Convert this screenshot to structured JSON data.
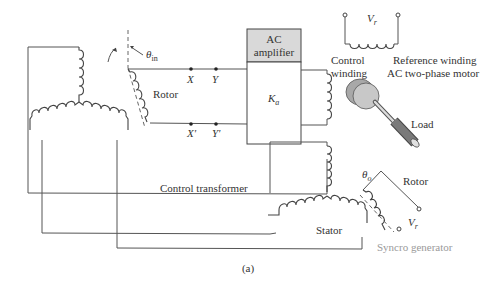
{
  "diagram": {
    "caption": "(a)",
    "labels": {
      "theta_in": "θ",
      "theta_in_sub": "in",
      "rotor_left": "Rotor",
      "terminal_x": "X",
      "terminal_y": "Y",
      "terminal_x_prime": "X'",
      "terminal_y_prime": "Y'",
      "amplifier_line1": "AC",
      "amplifier_line2": "amplifier",
      "gain": "K",
      "gain_sub": "a",
      "vr_top": "V",
      "vr_top_sub": "r",
      "control_winding_line1": "Control",
      "control_winding_line2": "winding",
      "reference_winding": "Reference winding",
      "motor": "AC two-phase motor",
      "load": "Load",
      "control_transformer": "Control transformer",
      "stator": "Stator",
      "theta_o": "θ",
      "theta_o_sub": "o",
      "rotor_right": "Rotor",
      "vr_bottom": "V",
      "vr_bottom_sub": "r",
      "syncro_generator": "Syncro generator"
    },
    "colors": {
      "amplifier_header_fill": "#d9d9d9",
      "motor_disc_fill": "#c8c8c8",
      "motor_disc_dark": "#a8a8a8",
      "syncro_label": "#9a9a9a"
    }
  }
}
